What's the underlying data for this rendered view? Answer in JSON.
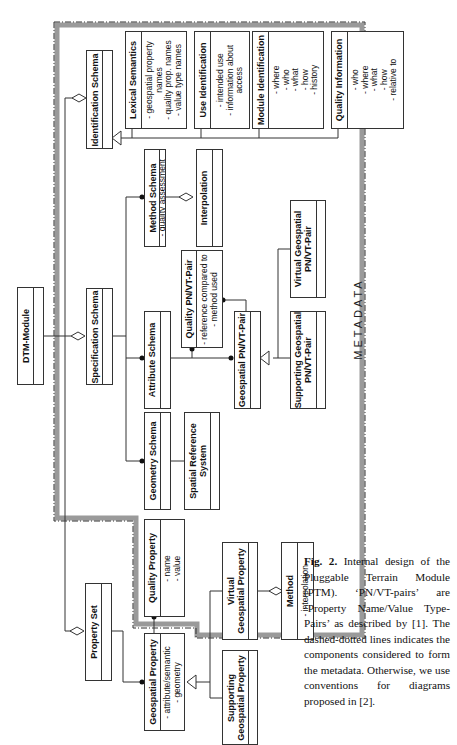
{
  "diagram": {
    "metadata_label": "METADATA",
    "boxes": {
      "dtm_module": {
        "name": "DTM-Module",
        "attrs": []
      },
      "identification_schema": {
        "name": "Identification Schema",
        "attrs": []
      },
      "specification_schema": {
        "name": "Specification Schema",
        "attrs": []
      },
      "property_set": {
        "name": "Property Set",
        "attrs": []
      },
      "lexical_semantics": {
        "name": "Lexical Semantics",
        "attrs_text": "- geospatial property\nnames\n- quality prop. names\n- value type names"
      },
      "use_identification": {
        "name": "Use Identification",
        "attrs_text": "- intended use\n- information about\naccess"
      },
      "module_identification": {
        "name": "Module Identification",
        "attrs_text": "- where\n- who\n- what\n- how\n- history"
      },
      "quality_information": {
        "name": "Quality Information",
        "attrs_text": "- who\n- where\n- what\n- how\n- relative to"
      },
      "method_schema": {
        "name": "Method Schema",
        "attrs_text": "- quality assessment"
      },
      "interpolation": {
        "name": "Interpolation",
        "attrs_text": ""
      },
      "attribute_schema": {
        "name": "Attribute Schema",
        "attrs_text": ""
      },
      "quality_pnvt_pair": {
        "name": "Quality PN/VT-Pair",
        "attrs_text": "- reference compared to\n- method used"
      },
      "geospatial_pnvt_pair": {
        "name": "Geospatial PN/VT-Pair",
        "attrs_text": ""
      },
      "virtual_geospatial_pnvt_pair": {
        "name": "Virtual Geospatial\nPN/VT-Pair",
        "attrs_text": ""
      },
      "supporting_geospatial_pnvt_pair": {
        "name": "Supporting Geospatial\nPN/VT-Pair",
        "attrs_text": ""
      },
      "geometry_schema": {
        "name": "Geometry Schema",
        "attrs_text": ""
      },
      "spatial_reference_system": {
        "name": "Spatial Reference\nSystem",
        "attrs_text": ""
      },
      "quality_property": {
        "name": "Quality Property",
        "attrs_text": "- name\n- value"
      },
      "geospatial_property": {
        "name": "Geospatial Property",
        "attrs_text": "- attribute/semantic\n- geometry"
      },
      "virtual_geospatial_property": {
        "name": "Virtual\nGeospatial Property",
        "attrs_text": ""
      },
      "supporting_geospatial_property": {
        "name": "Supporting\nGeospatial Property",
        "attrs_text": ""
      },
      "method": {
        "name": "Method",
        "attrs_text": "- interpolation"
      }
    }
  },
  "caption": {
    "label": "Fig. 2.",
    "text": " Internal design of the Pluggable Terrain Module (PTM). ‘PN/VT-pairs’ are ‘Property Name/Value Type-Pairs’ as described by [1]. The dashed-dotted lines indicates the components considered to form the metadata. Otherwise, we use conventions for diagrams proposed in [2]."
  }
}
